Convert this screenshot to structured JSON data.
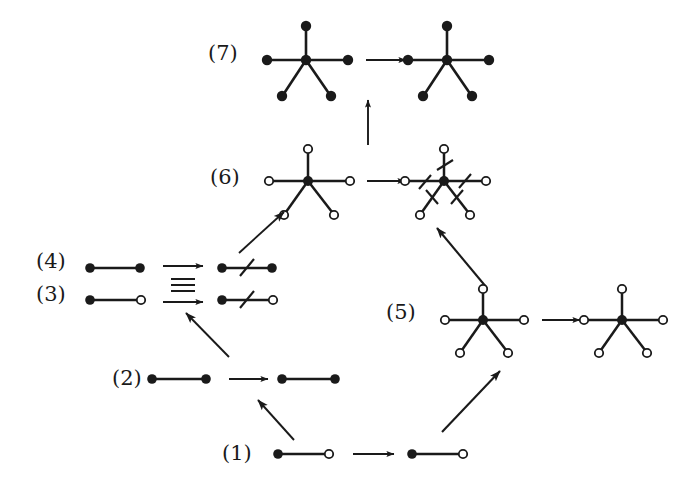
{
  "figure": {
    "background_color": "#ffffff",
    "ink_color": "#1a1a1a",
    "labels": [
      {
        "id": "label-7",
        "text": "(7)",
        "x": 208,
        "y": 41
      },
      {
        "id": "label-6",
        "text": "(6)",
        "x": 210,
        "y": 165
      },
      {
        "id": "label-4",
        "text": "(4)",
        "x": 36,
        "y": 249
      },
      {
        "id": "label-3",
        "text": "(3)",
        "x": 36,
        "y": 282
      },
      {
        "id": "label-5",
        "text": "(5)",
        "x": 386,
        "y": 300
      },
      {
        "id": "label-2",
        "text": "(2)",
        "x": 112,
        "y": 366
      },
      {
        "id": "label-1",
        "text": "(1)",
        "x": 222,
        "y": 441
      }
    ],
    "rows": [
      {
        "id": "row-7",
        "label": "(7)",
        "left_graph": {
          "type": "star5",
          "center": "filled",
          "leaves": "filled",
          "slashes": 0
        },
        "right_graph": {
          "type": "star5",
          "center": "filled",
          "leaves": "filled",
          "slashes": 0
        },
        "arrow": "right"
      },
      {
        "id": "row-6",
        "label": "(6)",
        "left_graph": {
          "type": "star5",
          "center": "filled",
          "leaves": "open",
          "slashes": 0
        },
        "right_graph": {
          "type": "star5",
          "center": "filled",
          "leaves": "open",
          "slashes": 5
        },
        "arrow": "right"
      },
      {
        "id": "row-4",
        "label": "(4)",
        "left_graph": {
          "type": "edge",
          "left_vertex": "filled",
          "right_vertex": "filled",
          "slashes": 0
        },
        "right_graph": {
          "type": "edge",
          "left_vertex": "filled",
          "right_vertex": "filled",
          "slashes": 1
        },
        "arrow": "right"
      },
      {
        "id": "row-3",
        "label": "(3)",
        "left_graph": {
          "type": "edge",
          "left_vertex": "filled",
          "right_vertex": "open",
          "slashes": 0
        },
        "right_graph": {
          "type": "edge",
          "left_vertex": "filled",
          "right_vertex": "open",
          "slashes": 1
        },
        "arrow": "right"
      },
      {
        "id": "row-5",
        "label": "(5)",
        "left_graph": {
          "type": "star5",
          "center": "filled",
          "leaves": "open",
          "slashes": 0
        },
        "right_graph": {
          "type": "star5",
          "center": "filled",
          "leaves": "open",
          "slashes": 0
        },
        "arrow": "right"
      },
      {
        "id": "row-2",
        "label": "(2)",
        "left_graph": {
          "type": "edge",
          "left_vertex": "filled",
          "right_vertex": "filled",
          "slashes": 0
        },
        "right_graph": {
          "type": "edge",
          "left_vertex": "filled",
          "right_vertex": "filled",
          "slashes": 0
        },
        "arrow": "right"
      },
      {
        "id": "row-1",
        "label": "(1)",
        "left_graph": {
          "type": "edge",
          "left_vertex": "filled",
          "right_vertex": "open",
          "slashes": 0
        },
        "right_graph": {
          "type": "edge",
          "left_vertex": "filled",
          "right_vertex": "open",
          "slashes": 0
        },
        "arrow": "right"
      }
    ],
    "connector_arrows": [
      {
        "id": "arrow-6-to-7",
        "from": "(6)",
        "to": "(7)",
        "direction": "up"
      },
      {
        "id": "arrow-34-to-6",
        "from": "(3)/(4)",
        "to": "(6)",
        "direction": "up-right"
      },
      {
        "id": "arrow-2-to-34",
        "from": "(2)",
        "to": "(3)/(4)",
        "direction": "up-left"
      },
      {
        "id": "arrow-1-to-2",
        "from": "(1)",
        "to": "(2)",
        "direction": "up-left"
      },
      {
        "id": "arrow-1-to-5",
        "from": "(1)",
        "to": "(5)",
        "direction": "up-right"
      },
      {
        "id": "arrow-5-to-6",
        "from": "(5)",
        "to": "(6)",
        "direction": "up-left"
      }
    ],
    "equivalence_symbol": {
      "id": "equivalence-bars",
      "glyph": "triple-bar",
      "bars": 3
    }
  }
}
